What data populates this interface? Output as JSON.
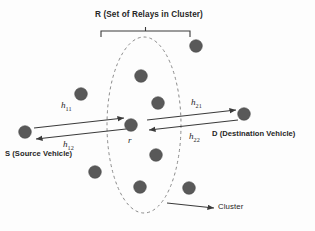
{
  "diagram": {
    "title_top": "R (Set of Relays in Cluster)",
    "source_label": "S (Source Vehicle)",
    "destination_label": "D (Destination Vehicle)",
    "relay_node_label": "r",
    "cluster_label": "Cluster",
    "channels": {
      "h11_base": "h",
      "h11_sub": "11",
      "h12_base": "h",
      "h12_sub": "12",
      "h21_base": "h",
      "h21_sub": "21",
      "h22_base": "h",
      "h22_sub": "22"
    },
    "colors": {
      "background": "#fdfdfd",
      "node_fill": "#595959",
      "node_stroke": "#4a4a4a",
      "arrow": "#3a3a3a",
      "cluster_outline": "#8a8a8a",
      "bracket": "#3a3a3a",
      "text": "#262626"
    },
    "cluster_ellipse": {
      "cx": 144,
      "cy": 125,
      "rx": 37,
      "ry": 88,
      "dash": "3 3"
    },
    "bracket": {
      "x_left": 101,
      "x_right": 190,
      "y": 31,
      "tick_height": 6,
      "center_tick": 4
    },
    "nodes": [
      {
        "name": "source-vehicle-node",
        "x": 25,
        "y": 132,
        "r": 6.3,
        "in_cluster": false
      },
      {
        "name": "outer-vehicle-node-upper-left",
        "x": 81,
        "y": 94,
        "r": 6.3,
        "in_cluster": false
      },
      {
        "name": "outer-vehicle-node-lower-left",
        "x": 95,
        "y": 172,
        "r": 6.3,
        "in_cluster": false
      },
      {
        "name": "relay-node-top",
        "x": 141,
        "y": 76,
        "r": 6.3,
        "in_cluster": true
      },
      {
        "name": "relay-node-center",
        "x": 131,
        "y": 125,
        "r": 6.3,
        "in_cluster": true
      },
      {
        "name": "relay-node-upper-right",
        "x": 158,
        "y": 103,
        "r": 6.3,
        "in_cluster": true
      },
      {
        "name": "relay-node-lower-right",
        "x": 156,
        "y": 155,
        "r": 6.3,
        "in_cluster": true
      },
      {
        "name": "relay-node-bottom",
        "x": 140,
        "y": 187,
        "r": 6.3,
        "in_cluster": true
      },
      {
        "name": "outer-vehicle-node-top-right",
        "x": 196,
        "y": 46,
        "r": 6.3,
        "in_cluster": false
      },
      {
        "name": "outer-vehicle-node-bottom-right",
        "x": 189,
        "y": 188,
        "r": 6.3,
        "in_cluster": false
      },
      {
        "name": "destination-vehicle-node",
        "x": 244,
        "y": 114,
        "r": 6.3,
        "in_cluster": false
      }
    ],
    "arrows": [
      {
        "name": "arrow-h11-source-to-relay",
        "x1": 34,
        "y1": 128,
        "x2": 124,
        "y2": 118
      },
      {
        "name": "arrow-h12-relay-to-source",
        "x1": 126,
        "y1": 129,
        "x2": 36,
        "y2": 139
      },
      {
        "name": "arrow-h21-relay-to-destination",
        "x1": 147,
        "y1": 120,
        "x2": 236,
        "y2": 110
      },
      {
        "name": "arrow-h22-destination-to-relay",
        "x1": 238,
        "y1": 120,
        "x2": 149,
        "y2": 130
      },
      {
        "name": "arrow-cluster-pointer",
        "x1": 167,
        "y1": 203,
        "x2": 214,
        "y2": 208
      }
    ]
  }
}
